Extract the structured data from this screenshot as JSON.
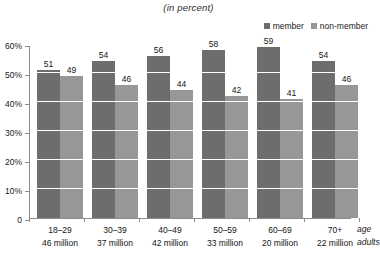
{
  "chart_data": {
    "type": "bar",
    "title": "(in percent)",
    "subtitle": "",
    "xlabel": "age",
    "xlabel_secondary": "adults",
    "ylabel": "",
    "ylim": [
      0,
      60
    ],
    "yticks": [
      "0",
      "10%",
      "20%",
      "30%",
      "40%",
      "50%",
      "60%"
    ],
    "ytick_values": [
      0,
      10,
      20,
      30,
      40,
      50,
      60
    ],
    "grid": "horizontal-white-on-bars",
    "legend_position": "top-right",
    "categories": [
      "18–29",
      "30–39",
      "40–49",
      "50–59",
      "60–69",
      "70+"
    ],
    "category_sublabels": [
      "46 million",
      "37 million",
      "42 million",
      "33 million",
      "20 million",
      "22 million"
    ],
    "series": [
      {
        "name": "member",
        "color": "#6d6d6d",
        "values": [
          51,
          54,
          56,
          58,
          59,
          54
        ]
      },
      {
        "name": "non-member",
        "color": "#979797",
        "values": [
          49,
          46,
          44,
          42,
          41,
          46
        ]
      }
    ]
  },
  "legend": {
    "items": [
      {
        "label": "member",
        "color": "#6d6d6d"
      },
      {
        "label": "non-member",
        "color": "#979797"
      }
    ]
  },
  "colors": {
    "member": "#6d6d6d",
    "non_member": "#979797",
    "axis": "#8c8c8c",
    "gridline": "#ffffff",
    "background": "#ffffff",
    "text": "#141414"
  }
}
